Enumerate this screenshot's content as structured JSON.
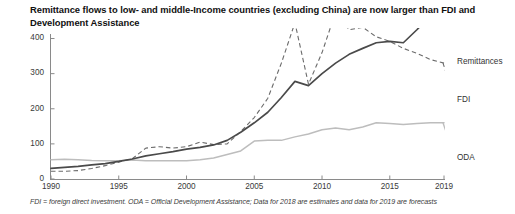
{
  "title": "Remittance flows to low- and middle-Income countries (excluding China) are now larger than FDI and Development Assistance",
  "footnote": "FDI = foreign direct investment. ODA = Official Development Assistance; Data for 2018 are estimates and data for 2019 are forecasts",
  "series_labels": {
    "remittances": "Remittances",
    "fdi": "FDI",
    "oda": "ODA"
  },
  "chart_data": {
    "type": "line",
    "title": "Remittance flows to low- and middle-Income countries (excluding China) are now larger than FDI and Development Assistance",
    "xlabel": "",
    "ylabel": "",
    "xlim": [
      1990,
      2019
    ],
    "ylim": [
      0,
      430
    ],
    "yticks": [
      0,
      100,
      200,
      300,
      400
    ],
    "ytick_labels": [
      "0",
      "100",
      "200",
      "300",
      "400"
    ],
    "xticks": [
      1990,
      1995,
      2000,
      2005,
      2010,
      2015,
      2019
    ],
    "xtick_labels": [
      "1990",
      "1995",
      "2000",
      "2005",
      "2010",
      "2015",
      "2019"
    ],
    "grid": false,
    "legend": "inline-right-of-line-ends",
    "x": [
      1990,
      1991,
      1992,
      1993,
      1994,
      1995,
      1996,
      1997,
      1998,
      1999,
      2000,
      2001,
      2002,
      2003,
      2004,
      2005,
      2006,
      2007,
      2008,
      2009,
      2010,
      2011,
      2012,
      2013,
      2014,
      2015,
      2016,
      2017,
      2018,
      2019
    ],
    "series": [
      {
        "name": "Remittances",
        "color": "#4a4a4a",
        "style": "solid",
        "values": [
          30,
          33,
          36,
          40,
          44,
          50,
          57,
          66,
          72,
          78,
          85,
          90,
          97,
          110,
          133,
          160,
          190,
          232,
          278,
          266,
          300,
          330,
          355,
          372,
          388,
          392,
          388,
          425,
          465,
          480
        ]
      },
      {
        "name": "FDI",
        "color": "#6b6b6b",
        "style": "dashed",
        "values": [
          22,
          22,
          24,
          30,
          38,
          48,
          58,
          88,
          92,
          88,
          92,
          105,
          98,
          100,
          135,
          175,
          230,
          330,
          445,
          270,
          360,
          475,
          425,
          432,
          405,
          392,
          372,
          358,
          340,
          330
        ]
      },
      {
        "name": "ODA",
        "color": "#bdbdbd",
        "style": "solid",
        "values": [
          55,
          56,
          55,
          53,
          52,
          52,
          54,
          52,
          52,
          52,
          52,
          55,
          60,
          70,
          80,
          108,
          110,
          110,
          120,
          128,
          140,
          145,
          140,
          148,
          160,
          158,
          155,
          158,
          160,
          160
        ]
      }
    ]
  }
}
